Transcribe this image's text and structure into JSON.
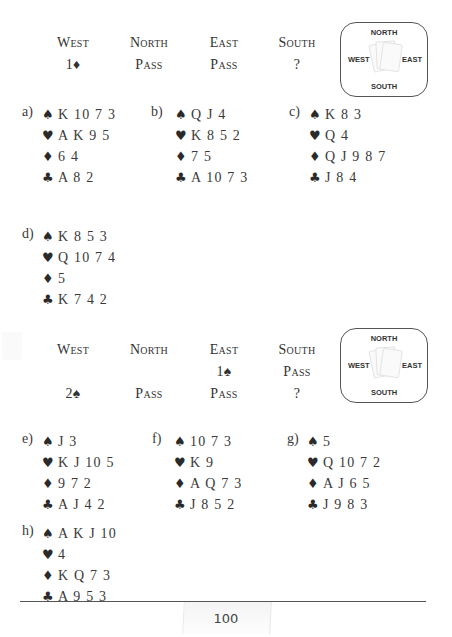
{
  "auctions": [
    {
      "headers": [
        "West",
        "North",
        "East",
        "South"
      ],
      "rows": [
        [
          "1♦",
          "Pass",
          "Pass",
          "?"
        ]
      ],
      "compass": {
        "north": "NORTH",
        "south": "SOUTH",
        "west": "WEST",
        "east": "EAST"
      }
    },
    {
      "headers": [
        "West",
        "North",
        "East",
        "South"
      ],
      "rows": [
        [
          "",
          "",
          "1♠",
          "Pass"
        ],
        [
          "2♠",
          "Pass",
          "Pass",
          "?"
        ]
      ],
      "compass": {
        "north": "NORTH",
        "south": "SOUTH",
        "west": "WEST",
        "east": "EAST"
      }
    }
  ],
  "suit_symbols": {
    "spades": "♠",
    "hearts": "♥",
    "diamonds": "♦",
    "clubs": "♣"
  },
  "hands": [
    {
      "label": "a)",
      "spades": "K 10 7 3",
      "hearts": "A K 9 5",
      "diamonds": "6 4",
      "clubs": "A 8 2"
    },
    {
      "label": "b)",
      "spades": "Q J 4",
      "hearts": "K 8 5 2",
      "diamonds": "7 5",
      "clubs": "A 10 7 3"
    },
    {
      "label": "c)",
      "spades": "K 8 3",
      "hearts": "Q 4",
      "diamonds": "Q J 9 8 7",
      "clubs": "J 8 4"
    },
    {
      "label": "d)",
      "spades": "K 8 5 3",
      "hearts": "Q 10 7 4",
      "diamonds": "5",
      "clubs": "K 7 4 2"
    },
    {
      "label": "e)",
      "spades": "J 3",
      "hearts": "K J 10 5",
      "diamonds": "9 7 2",
      "clubs": "A J 4 2"
    },
    {
      "label": "f)",
      "spades": "10 7 3",
      "hearts": "K 9",
      "diamonds": "A Q 7 3",
      "clubs": "J 8 5 2"
    },
    {
      "label": "g)",
      "spades": "5",
      "hearts": "Q 10 7 2",
      "diamonds": "A J 6 5",
      "clubs": "J 9 8 3"
    },
    {
      "label": "h)",
      "spades": "A K J 10",
      "hearts": "4",
      "diamonds": "K Q 7 3",
      "clubs": "A 9 5 3"
    }
  ],
  "footer": {
    "page_number": "100"
  }
}
